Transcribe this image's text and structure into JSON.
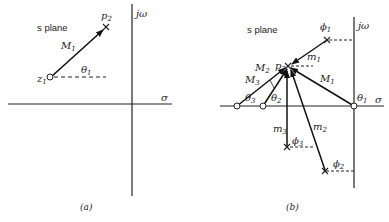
{
  "panel_a": {
    "caption": "(a)",
    "plane_label": "s plane",
    "axis_x_label": "σ",
    "axis_y_label": "jω",
    "zero_label": "z",
    "zero_sub": "1",
    "pole_label": "p",
    "pole_sub": "2",
    "vector_label": "M",
    "vector_sub": "1",
    "angle_label": "θ",
    "angle_sub": "1"
  },
  "panel_b": {
    "caption": "(b)",
    "plane_label": "s plane",
    "axis_x_label": "σ",
    "axis_y_label": "jω",
    "point_label": "p",
    "point_sub": "2",
    "zero_vectors": [
      {
        "label": "M",
        "sub": "1",
        "angle": "θ",
        "angle_sub": "1"
      },
      {
        "label": "M",
        "sub": "2",
        "angle": "θ",
        "angle_sub": "2"
      },
      {
        "label": "M",
        "sub": "3",
        "angle": "θ",
        "angle_sub": "3"
      }
    ],
    "pole_vectors": [
      {
        "label": "m",
        "sub": "1",
        "angle": "ϕ",
        "angle_sub": "1"
      },
      {
        "label": "m",
        "sub": "2",
        "angle": "ϕ",
        "angle_sub": "2"
      },
      {
        "label": "m",
        "sub": "3",
        "angle": "ϕ",
        "angle_sub": "3"
      }
    ]
  }
}
